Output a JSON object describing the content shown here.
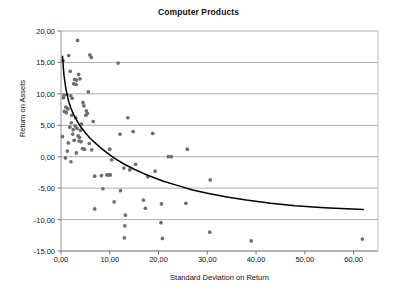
{
  "chart_data": {
    "type": "scatter",
    "title": "Computer Products",
    "xlabel": "Standard Deviation on Return",
    "ylabel": "Return on Assets",
    "xlim": [
      0,
      65
    ],
    "ylim": [
      -15,
      20
    ],
    "xticks": [
      "0,00",
      "10,00",
      "20,00",
      "30,00",
      "40,00",
      "50,00",
      "60,00"
    ],
    "xtick_values": [
      0,
      10,
      20,
      30,
      40,
      50,
      60
    ],
    "yticks": [
      "20,00",
      "15,00",
      "10,00",
      "5,00",
      "0,00",
      "-5,00",
      "-10,00",
      "-15,00"
    ],
    "ytick_values": [
      20,
      15,
      10,
      5,
      0,
      -5,
      -10,
      -15
    ],
    "grid": "horizontal",
    "legend": "none",
    "decimal_separator": ",",
    "marker_color": "#6e6e6e",
    "curve_color": "#000000",
    "grid_color": "#9a9a9a",
    "frame_color": "#b0b0b0",
    "series": [
      {
        "name": "Companies",
        "marker": "circle",
        "points": [
          [
            3.4,
            18.5
          ],
          [
            1.6,
            16.1
          ],
          [
            5.9,
            16.2
          ],
          [
            6.2,
            15.8
          ],
          [
            0.4,
            15.3
          ],
          [
            11.7,
            14.9
          ],
          [
            1.9,
            13.6
          ],
          [
            3.6,
            13.1
          ],
          [
            2.8,
            12.3
          ],
          [
            3.2,
            12.2
          ],
          [
            3.9,
            12.4
          ],
          [
            2.6,
            11.6
          ],
          [
            3.1,
            11.5
          ],
          [
            5.6,
            10.3
          ],
          [
            0.6,
            9.8
          ],
          [
            1.2,
            9.9
          ],
          [
            2.0,
            9.7
          ],
          [
            2.3,
            9.3
          ],
          [
            0.5,
            9.4
          ],
          [
            4.5,
            8.6
          ],
          [
            4.7,
            8.1
          ],
          [
            1.0,
            7.9
          ],
          [
            1.4,
            7.6
          ],
          [
            0.7,
            7.2
          ],
          [
            1.1,
            7.0
          ],
          [
            5.2,
            7.3
          ],
          [
            5.4,
            6.9
          ],
          [
            5.1,
            6.6
          ],
          [
            2.2,
            6.6
          ],
          [
            3.0,
            6.2
          ],
          [
            13.7,
            6.2
          ],
          [
            6.6,
            5.6
          ],
          [
            2.1,
            5.4
          ],
          [
            4.2,
            5.2
          ],
          [
            2.9,
            4.9
          ],
          [
            1.8,
            4.7
          ],
          [
            3.3,
            4.5
          ],
          [
            2.5,
            4.3
          ],
          [
            4.0,
            4.2
          ],
          [
            0.3,
            3.2
          ],
          [
            2.4,
            3.6
          ],
          [
            3.5,
            3.3
          ],
          [
            3.8,
            3.1
          ],
          [
            12.1,
            3.6
          ],
          [
            14.8,
            4.0
          ],
          [
            18.8,
            3.7
          ],
          [
            2.7,
            2.6
          ],
          [
            3.7,
            2.5
          ],
          [
            4.1,
            2.4
          ],
          [
            1.5,
            2.2
          ],
          [
            5.8,
            2.1
          ],
          [
            4.4,
            1.3
          ],
          [
            4.8,
            1.2
          ],
          [
            6.3,
            1.1
          ],
          [
            10.0,
            1.2
          ],
          [
            25.9,
            1.2
          ],
          [
            1.3,
            0.9
          ],
          [
            3.15,
            0.6
          ],
          [
            22.0,
            0.0
          ],
          [
            22.6,
            0.0
          ],
          [
            0.9,
            -0.2
          ],
          [
            2.05,
            -0.8
          ],
          [
            10.4,
            -0.5
          ],
          [
            15.3,
            -1.2
          ],
          [
            12.9,
            -1.8
          ],
          [
            14.1,
            -2.1
          ],
          [
            19.3,
            -2.3
          ],
          [
            6.9,
            -3.1
          ],
          [
            8.3,
            -3.0
          ],
          [
            9.4,
            -2.9
          ],
          [
            9.8,
            -2.9
          ],
          [
            10.1,
            -2.9
          ],
          [
            17.8,
            -3.2
          ],
          [
            30.6,
            -3.7
          ],
          [
            8.6,
            -5.1
          ],
          [
            12.2,
            -5.4
          ],
          [
            10.9,
            -7.2
          ],
          [
            16.9,
            -6.9
          ],
          [
            6.9,
            -8.3
          ],
          [
            13.2,
            -9.3
          ],
          [
            17.3,
            -8.2
          ],
          [
            20.6,
            -7.5
          ],
          [
            25.6,
            -7.4
          ],
          [
            13.1,
            -11.0
          ],
          [
            20.5,
            -10.5
          ],
          [
            13.0,
            -12.9
          ],
          [
            20.8,
            -13.0
          ],
          [
            30.5,
            -12.0
          ],
          [
            39.0,
            -13.4
          ],
          [
            61.8,
            -13.1
          ]
        ]
      }
    ],
    "trend_curve": {
      "name": "Fitted trend",
      "points": [
        [
          0.3,
          16.0
        ],
        [
          0.6,
          13.0
        ],
        [
          1.0,
          10.8
        ],
        [
          1.5,
          9.0
        ],
        [
          2.0,
          7.8
        ],
        [
          2.6,
          6.7
        ],
        [
          3.2,
          5.8
        ],
        [
          4.0,
          4.8
        ],
        [
          5.0,
          3.8
        ],
        [
          6.0,
          2.9
        ],
        [
          7.0,
          2.2
        ],
        [
          8.0,
          1.5
        ],
        [
          9.0,
          0.9
        ],
        [
          10.0,
          0.3
        ],
        [
          11.5,
          -0.5
        ],
        [
          13.0,
          -1.2
        ],
        [
          15.0,
          -2.0
        ],
        [
          17.0,
          -2.7
        ],
        [
          19.0,
          -3.3
        ],
        [
          21.0,
          -3.9
        ],
        [
          24.0,
          -4.6
        ],
        [
          27.0,
          -5.3
        ],
        [
          30.0,
          -5.8
        ],
        [
          34.0,
          -6.4
        ],
        [
          38.0,
          -6.9
        ],
        [
          43.0,
          -7.4
        ],
        [
          48.0,
          -7.8
        ],
        [
          54.0,
          -8.1
        ],
        [
          62.0,
          -8.4
        ]
      ]
    }
  }
}
